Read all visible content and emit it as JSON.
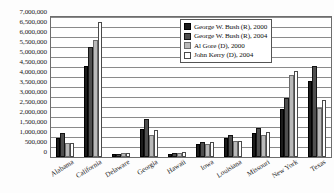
{
  "chart_data": {
    "type": "bar",
    "title": "",
    "subtitle": "",
    "xlabel": "",
    "ylabel": "",
    "ylim": [
      0,
      7000000
    ],
    "ytick_step": 500000,
    "grid": true,
    "legend_position": "top-right-inside",
    "ytick_labels": [
      "7,000,000",
      "6,500,000",
      "6,000,000",
      "5,500,000",
      "5,000,000",
      "4,500,000",
      "4,000,000",
      "3,500,000",
      "3,000,000",
      "2,500,000",
      "2,000,000",
      "1,500,000",
      "1,000,000",
      "500,000",
      "0"
    ],
    "ytick_values": [
      7000000,
      6500000,
      6000000,
      5500000,
      5000000,
      4500000,
      4000000,
      3500000,
      3000000,
      2500000,
      2000000,
      1500000,
      1000000,
      500000,
      0
    ],
    "categories": [
      "Alabama",
      "California",
      "Delaware",
      "Georgia",
      "Hawaii",
      "Iowa",
      "Louisiana",
      "Missouri",
      "New York",
      "Texas"
    ],
    "series": [
      {
        "name": "George W. Bush (R), 2000",
        "color": "#1b1b1b",
        "values": [
          944000,
          4567000,
          137000,
          1420000,
          138000,
          634000,
          928000,
          1190000,
          2403000,
          3800000
        ]
      },
      {
        "name": "George W. Bush (R), 2004",
        "color": "#4f4f4f",
        "values": [
          1176000,
          5510000,
          172000,
          1914000,
          194000,
          752000,
          1102000,
          1455000,
          2962000,
          4527000
        ]
      },
      {
        "name": "Al Gore (D), 2000",
        "color": "#b9b9b9",
        "values": [
          693000,
          5861000,
          180000,
          1116000,
          206000,
          639000,
          792000,
          1111000,
          4107000,
          2433000
        ]
      },
      {
        "name": "John Kerry (D), 2004",
        "color": "#ffffff",
        "values": [
          693000,
          6745000,
          200000,
          1366000,
          231000,
          742000,
          820000,
          1259000,
          4314000,
          2832000
        ]
      }
    ]
  },
  "legend": {
    "items": [
      {
        "label": "George W. Bush (R), 2000"
      },
      {
        "label": "George W. Bush (R), 2004"
      },
      {
        "label": "Al Gore (D), 2000"
      },
      {
        "label": "John Kerry (D), 2004"
      }
    ]
  }
}
